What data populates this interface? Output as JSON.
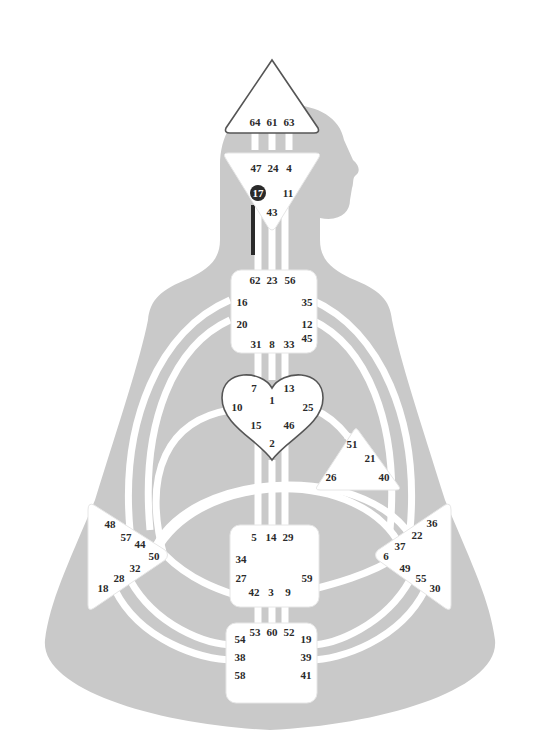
{
  "colors": {
    "silhouette": "#c9c9c9",
    "channel": "#ffffff",
    "center_fill": "#ffffff",
    "defined": "#2a2a2a",
    "outline": "#555555"
  },
  "centers": {
    "head": {
      "name": "Head",
      "gates": [
        "64",
        "61",
        "63"
      ]
    },
    "ajna": {
      "name": "Ajna",
      "gates": [
        "47",
        "24",
        "4",
        "17",
        "11",
        "43"
      ]
    },
    "throat": {
      "name": "Throat",
      "gates": [
        "62",
        "23",
        "56",
        "16",
        "35",
        "20",
        "12",
        "45",
        "31",
        "8",
        "33"
      ]
    },
    "g": {
      "name": "G Center",
      "gates": [
        "7",
        "13",
        "1",
        "10",
        "25",
        "15",
        "46",
        "2"
      ]
    },
    "ego": {
      "name": "Heart/Ego",
      "gates": [
        "51",
        "21",
        "26",
        "40"
      ]
    },
    "spleen": {
      "name": "Spleen",
      "gates": [
        "48",
        "57",
        "44",
        "50",
        "32",
        "28",
        "18"
      ]
    },
    "sacral": {
      "name": "Sacral",
      "gates": [
        "5",
        "14",
        "29",
        "34",
        "27",
        "59",
        "42",
        "3",
        "9"
      ]
    },
    "solar": {
      "name": "Solar Plexus",
      "gates": [
        "36",
        "22",
        "37",
        "6",
        "49",
        "55",
        "30"
      ]
    },
    "root": {
      "name": "Root",
      "gates": [
        "53",
        "60",
        "52",
        "54",
        "19",
        "38",
        "39",
        "58",
        "41"
      ]
    }
  },
  "defined_gates": [
    "17"
  ],
  "defined_channels": [
    {
      "from": "17",
      "to": "62",
      "status": "half"
    }
  ]
}
